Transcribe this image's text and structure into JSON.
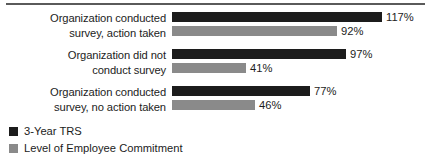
{
  "chart_data": {
    "type": "bar",
    "orientation": "horizontal",
    "title": "",
    "subtitle": "",
    "xlabel": "",
    "ylabel": "",
    "grid": false,
    "legend_position": "bottom-left",
    "xlim": [
      0,
      117
    ],
    "value_suffix": "%",
    "categories": [
      "Organization conducted survey, action taken",
      "Organization did not conduct survey",
      "Organization conducted survey, no action taken"
    ],
    "series": [
      {
        "name": "3-Year TRS",
        "color": "#1c1c1c",
        "values": [
          117,
          92,
          77
        ],
        "labels": [
          "117%",
          "97%",
          "77%"
        ]
      },
      {
        "name": "Level of Employee Commitment",
        "color": "#8a8a8a",
        "values": [
          92,
          41,
          46
        ],
        "labels": [
          "92%",
          "41%",
          "46%"
        ]
      }
    ],
    "groups": [
      {
        "category": "Organization conducted survey, action taken",
        "category_line1": "Organization conducted",
        "category_line2": "survey, action taken",
        "bars": [
          {
            "series": "3-Year TRS",
            "value": 117,
            "label": "117%"
          },
          {
            "series": "Level of Employee Commitment",
            "value": 92,
            "label": "92%"
          }
        ]
      },
      {
        "category": "Organization did not conduct survey",
        "category_line1": "Organization did not",
        "category_line2": "conduct survey",
        "bars": [
          {
            "series": "3-Year TRS",
            "value": 97,
            "label": "97%"
          },
          {
            "series": "Level of Employee Commitment",
            "value": 41,
            "label": "41%"
          }
        ]
      },
      {
        "category": "Organization conducted survey, no action taken",
        "category_line1": "Organization conducted",
        "category_line2": "survey, no action taken",
        "bars": [
          {
            "series": "3-Year TRS",
            "value": 77,
            "label": "77%"
          },
          {
            "series": "Level of Employee Commitment",
            "value": 46,
            "label": "46%"
          }
        ]
      }
    ],
    "legend": [
      {
        "label": "3-Year TRS",
        "color": "#1c1c1c"
      },
      {
        "label": "Level of Employee Commitment",
        "color": "#8a8a8a"
      }
    ]
  }
}
